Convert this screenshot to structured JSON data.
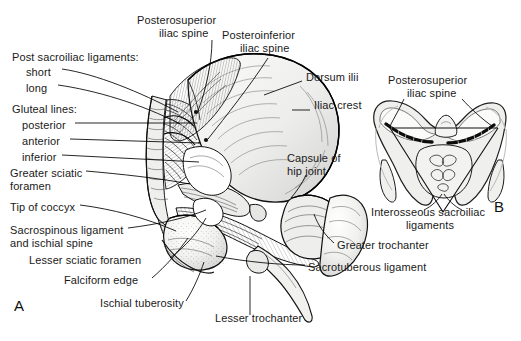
{
  "figure": {
    "panel_a_letter": "A",
    "panel_b_letter": "B"
  },
  "labels_panel_a": [
    {
      "id": "post-sacroiliac-ligaments",
      "text": "Post sacroiliac ligaments:",
      "x": 12,
      "y": 57,
      "align": "left"
    },
    {
      "id": "short",
      "text": "short",
      "x": 26,
      "y": 72,
      "align": "left"
    },
    {
      "id": "long",
      "text": "long",
      "x": 26,
      "y": 88,
      "align": "left"
    },
    {
      "id": "gluteal-lines",
      "text": "Gluteal lines:",
      "x": 12,
      "y": 109,
      "align": "left"
    },
    {
      "id": "posterior",
      "text": "posterior",
      "x": 22,
      "y": 126,
      "align": "left"
    },
    {
      "id": "anterior",
      "text": "anterior",
      "x": 22,
      "y": 142,
      "align": "left"
    },
    {
      "id": "inferior",
      "text": "inferior",
      "x": 22,
      "y": 158,
      "align": "left"
    },
    {
      "id": "greater-sciatic-foramen-line1",
      "text": "Greater sciatic",
      "x": 10,
      "y": 174,
      "align": "left"
    },
    {
      "id": "greater-sciatic-foramen-line2",
      "text": "foramen",
      "x": 10,
      "y": 187,
      "align": "left"
    },
    {
      "id": "tip-of-coccyx",
      "text": "Tip of coccyx",
      "x": 10,
      "y": 208,
      "align": "left"
    },
    {
      "id": "sacrospinous-ligament-line1",
      "text": "Sacrospinous ligament",
      "x": 10,
      "y": 231,
      "align": "left"
    },
    {
      "id": "sacrospinous-ligament-line2",
      "text": "and ischial spine",
      "x": 10,
      "y": 244,
      "align": "left"
    },
    {
      "id": "lesser-sciatic-foramen",
      "text": "Lesser sciatic foramen",
      "x": 29,
      "y": 261,
      "align": "left"
    },
    {
      "id": "falciform-edge",
      "text": "Falciform edge",
      "x": 64,
      "y": 281,
      "align": "left"
    },
    {
      "id": "ischial-tuberosity",
      "text": "Ischial tuberosity",
      "x": 100,
      "y": 304,
      "align": "left"
    },
    {
      "id": "lesser-trochanter",
      "text": "Lesser trochanter",
      "x": 215,
      "y": 319,
      "align": "left"
    },
    {
      "id": "posterosuperior-iliac-spine-line1",
      "text": "Posterosuperior",
      "x": 137,
      "y": 21,
      "align": "left"
    },
    {
      "id": "posterosuperior-iliac-spine-line2",
      "text": "iliac spine",
      "x": 159,
      "y": 34,
      "align": "left"
    },
    {
      "id": "posteroinferior-iliac-spine-line1",
      "text": "Posteroinferior",
      "x": 222,
      "y": 36,
      "align": "left"
    },
    {
      "id": "posteroinferior-iliac-spine-line2",
      "text": "iliac spine",
      "x": 240,
      "y": 49,
      "align": "left"
    },
    {
      "id": "dorsum-ilii",
      "text": "Dorsum ilii",
      "x": 306,
      "y": 78,
      "align": "left"
    },
    {
      "id": "iliac-crest",
      "text": "Iliac crest",
      "x": 314,
      "y": 106,
      "align": "left"
    },
    {
      "id": "capsule-of-hip-joint-line1",
      "text": "Capsule of",
      "x": 287,
      "y": 159,
      "align": "left"
    },
    {
      "id": "capsule-of-hip-joint-line2",
      "text": "hip joint",
      "x": 287,
      "y": 172,
      "align": "left"
    },
    {
      "id": "greater-trochanter",
      "text": "Greater trochanter",
      "x": 337,
      "y": 246,
      "align": "left"
    },
    {
      "id": "sacrotuberous-ligament",
      "text": "Sacrotuberous ligament",
      "x": 308,
      "y": 268,
      "align": "left"
    }
  ],
  "labels_panel_b": [
    {
      "id": "b-posterosuperior-iliac-spine-line1",
      "text": "Posterosuperior",
      "x": 388,
      "y": 81,
      "align": "left"
    },
    {
      "id": "b-posterosuperior-iliac-spine-line2",
      "text": "iliac spine",
      "x": 407,
      "y": 94,
      "align": "left"
    },
    {
      "id": "b-interosseous-sacroiliac-line1",
      "text": "Interosseous sacroiliac",
      "x": 371,
      "y": 213,
      "align": "left"
    },
    {
      "id": "b-interosseous-sacroiliac-line2",
      "text": "ligaments",
      "x": 406,
      "y": 226,
      "align": "left"
    }
  ],
  "colors": {
    "ink": "#000000",
    "paper": "#ffffff",
    "bone_fill": "#f2f2f0",
    "shadow": "#cfcfcf",
    "mid_gray": "#9a9a9a"
  },
  "artwork": {
    "panel_a_caption": "Posterior view of the hip and sacroiliac region showing ligaments, foramina and bony landmarks",
    "panel_b_caption": "Transverse section through the sacroiliac joints showing interosseous sacroiliac ligaments"
  }
}
